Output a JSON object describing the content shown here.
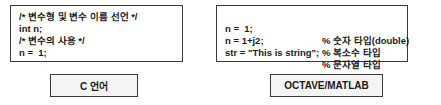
{
  "c_panel": {
    "code_lines": [
      "/* 변수형 및 변수 이름 선언 */",
      "int n;",
      "/* 변수의 사용 */",
      "n =  1;"
    ],
    "label": "C 언어"
  },
  "matlab_panel": {
    "code_lines": [
      {
        "code": "n =  1;",
        "comment": "% 숫자 타입(double)"
      },
      {
        "code": "n = 1+j2;",
        "comment": "% 복소수 타입"
      },
      {
        "code": "str = \"This is string\";",
        "comment": "% 문자열 타입"
      }
    ],
    "label": "OCTAVE/MATLAB"
  }
}
